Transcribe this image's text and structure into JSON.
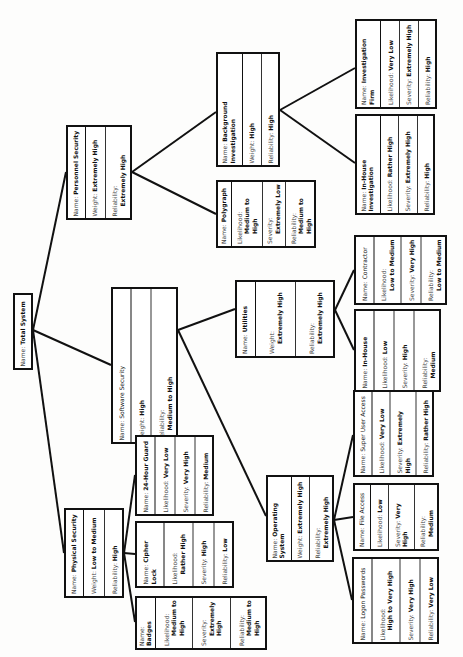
{
  "diagram": {
    "orientation": "rotated-90-ccw",
    "labels": {
      "name": "Name:",
      "weight": "Weight:",
      "reliability": "Reliability:",
      "likelihood": "Likelihood:",
      "severity": "Severity:"
    },
    "nodes": {
      "total": {
        "name": "Total System"
      },
      "physical": {
        "name": "Physical Security",
        "weight": "Low to Medium",
        "reliability": "High"
      },
      "personnel": {
        "name": "Personnel Security",
        "weight": "Extremely High",
        "reliability": "Extremely High"
      },
      "software": {
        "name": "Software Security",
        "weight": "High",
        "reliability": "Medium to High"
      },
      "background": {
        "name": "Background Investigation",
        "weight": "High",
        "reliability": "High"
      },
      "polygraph": {
        "name": "Polygraph",
        "likelihood": "Medium to High",
        "severity": "Extremely Low",
        "reliability": "Medium to High"
      },
      "invfirm": {
        "name": "Investigation Firm",
        "likelihood": "Very Low",
        "severity": "Extremely High",
        "reliability": "High"
      },
      "inhouseinv": {
        "name": "In-House Investigation",
        "likelihood": "Rather High",
        "severity": "Extremely High",
        "reliability": "High"
      },
      "utilities": {
        "name": "Utilities",
        "weight": "Extremely High",
        "reliability": "Extremely High"
      },
      "contractor": {
        "name": "Contractor",
        "likelihood": "Low to Medium",
        "severity": "Very High",
        "reliability": "Low to Medium"
      },
      "inhouse": {
        "name": "In-House",
        "likelihood": "Low",
        "severity": "High",
        "reliability": "Medium"
      },
      "guard": {
        "name": "24-Hour Guard",
        "likelihood": "Very Low",
        "severity": "Very High",
        "reliability": "Medium"
      },
      "cipher": {
        "name": "Cipher Lock",
        "likelihood": "Rather High",
        "severity": "High",
        "reliability": "Low"
      },
      "badges": {
        "name": "Badges",
        "likelihood": "Medium to High",
        "severity": "Extremely High",
        "reliability": "Medium to High"
      },
      "os": {
        "name": "Operating System",
        "weight": "Extremely High",
        "reliability": "Extremely High"
      },
      "superuser": {
        "name": "Super User Access",
        "likelihood": "Very Low",
        "severity": "Extremely High",
        "reliability": "Rather High"
      },
      "fileaccess": {
        "name": "File Access",
        "likelihood": "Low",
        "severity": "Very High",
        "reliability": "Medium"
      },
      "logon": {
        "name": "Logon Passwords",
        "likelihood": "High to Very High",
        "severity": "Very High",
        "reliability": "Very Low"
      }
    },
    "edges": [
      [
        "total",
        "personnel"
      ],
      [
        "total",
        "software"
      ],
      [
        "total",
        "physical"
      ],
      [
        "personnel",
        "background"
      ],
      [
        "personnel",
        "polygraph"
      ],
      [
        "background",
        "invfirm"
      ],
      [
        "background",
        "inhouseinv"
      ],
      [
        "software",
        "utilities"
      ],
      [
        "software",
        "os"
      ],
      [
        "utilities",
        "contractor"
      ],
      [
        "utilities",
        "inhouse"
      ],
      [
        "physical",
        "guard"
      ],
      [
        "physical",
        "cipher"
      ],
      [
        "physical",
        "badges"
      ],
      [
        "os",
        "superuser"
      ],
      [
        "os",
        "fileaccess"
      ],
      [
        "os",
        "logon"
      ]
    ],
    "colors": {
      "line": "#111111",
      "background": "#fdfdfc"
    }
  }
}
